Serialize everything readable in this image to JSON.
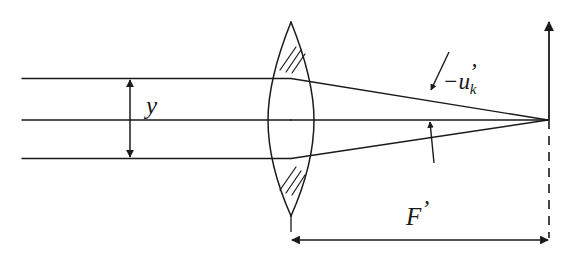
{
  "figure": {
    "type": "optical-ray-diagram",
    "width": 577,
    "height": 268,
    "background_color": "#ffffff",
    "stroke_color": "#1a1a1a"
  },
  "labels": {
    "ray_height": "y",
    "marginal_ray_angle_minus": "−",
    "marginal_ray_angle_symbol": "u",
    "marginal_ray_angle_prime": "’",
    "marginal_ray_angle_subscript": "k",
    "focal_length": "F",
    "focal_length_prime": "’"
  },
  "geometry": {
    "optical_axis_y": 120,
    "upper_ray_y": 78,
    "lower_ray_y": 158,
    "ray_start_x": 22,
    "lens_center_x": 291,
    "lens_top_y": 22,
    "lens_bottom_y": 216,
    "lens_left_vertex_x": 268,
    "lens_right_vertex_x": 314,
    "focal_point_x": 548,
    "focal_point_y": 120,
    "image_plane_top_y": 20,
    "dimension_line_y": 240,
    "dimension_left_x": 291,
    "dimension_right_x": 549
  },
  "elements": {
    "upper_marginal_ray": "incoming parallel ray above axis",
    "optical_axis_ray": "on-axis ray",
    "lower_marginal_ray": "incoming parallel ray below axis",
    "lens": "biconvex lens with hatched upper and lower margins",
    "hatching_top": "3 diagonal hatch strokes",
    "hatching_bottom": "3 diagonal hatch strokes",
    "y_dimension": "double-headed vertical arrow between upper ray and axis",
    "angle_pointer": "leader arrow pointing to refracted lower ray",
    "angle_pointer_up": "arrow pointing up to axis",
    "image_plane_axis": "solid vertical arrow at focal point pointing up",
    "image_plane_dashed": "dashed vertical extension below focal point",
    "focal_dimension": "double-headed horizontal dimension arrow",
    "lens_tick": "short vertical extension tick below lens"
  }
}
